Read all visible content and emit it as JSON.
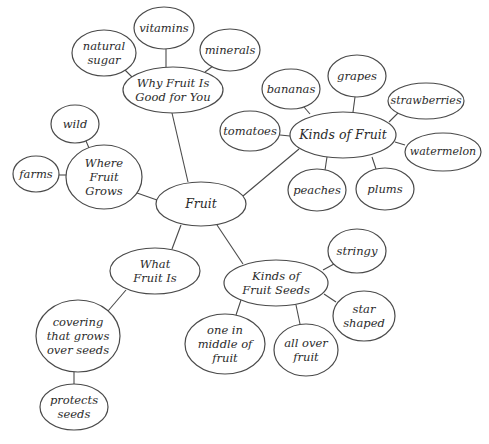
{
  "diagram": {
    "type": "mind-map",
    "line_color": "#4a4a4a",
    "background": "#ffffff",
    "nodes": [
      {
        "id": "fruit",
        "label": "Fruit",
        "cx": 201,
        "cy": 204,
        "rx": 45,
        "ry": 22
      },
      {
        "id": "why",
        "label": "Why Fruit Is\nGood for You",
        "cx": 173,
        "cy": 90,
        "rx": 50,
        "ry": 23
      },
      {
        "id": "vitamins",
        "label": "vitamins",
        "cx": 164,
        "cy": 28,
        "rx": 30,
        "ry": 21
      },
      {
        "id": "natural-sugar",
        "label": "natural\nsugar",
        "cx": 104,
        "cy": 53,
        "rx": 32,
        "ry": 23
      },
      {
        "id": "minerals",
        "label": "minerals",
        "cx": 230,
        "cy": 50,
        "rx": 30,
        "ry": 21
      },
      {
        "id": "kinds-of-fruit",
        "label": "Kinds of Fruit",
        "cx": 343,
        "cy": 135,
        "rx": 53,
        "ry": 23
      },
      {
        "id": "bananas",
        "label": "bananas",
        "cx": 291,
        "cy": 89,
        "rx": 29,
        "ry": 20
      },
      {
        "id": "grapes",
        "label": "grapes",
        "cx": 357,
        "cy": 76,
        "rx": 29,
        "ry": 21
      },
      {
        "id": "strawberries",
        "label": "strawberries",
        "cx": 426,
        "cy": 101,
        "rx": 38,
        "ry": 18
      },
      {
        "id": "tomatoes",
        "label": "tomatoes",
        "cx": 250,
        "cy": 131,
        "rx": 30,
        "ry": 20
      },
      {
        "id": "watermelon",
        "label": "watermelon",
        "cx": 443,
        "cy": 152,
        "rx": 38,
        "ry": 19
      },
      {
        "id": "peaches",
        "label": "peaches",
        "cx": 317,
        "cy": 190,
        "rx": 29,
        "ry": 21
      },
      {
        "id": "plums",
        "label": "plums",
        "cx": 385,
        "cy": 189,
        "rx": 29,
        "ry": 21
      },
      {
        "id": "where",
        "label": "Where\nFruit\nGrows",
        "cx": 104,
        "cy": 177,
        "rx": 38,
        "ry": 32
      },
      {
        "id": "wild",
        "label": "wild",
        "cx": 75,
        "cy": 124,
        "rx": 24,
        "ry": 19
      },
      {
        "id": "farms",
        "label": "farms",
        "cx": 36,
        "cy": 174,
        "rx": 23,
        "ry": 18
      },
      {
        "id": "what",
        "label": "What\nFruit Is",
        "cx": 155,
        "cy": 271,
        "rx": 45,
        "ry": 23
      },
      {
        "id": "covering",
        "label": "covering\nthat grows\nover seeds",
        "cx": 78,
        "cy": 336,
        "rx": 42,
        "ry": 36
      },
      {
        "id": "protects",
        "label": "protects\nseeds",
        "cx": 74,
        "cy": 407,
        "rx": 34,
        "ry": 23
      },
      {
        "id": "kinds-of-seeds",
        "label": "Kinds of\nFruit Seeds",
        "cx": 276,
        "cy": 283,
        "rx": 52,
        "ry": 23
      },
      {
        "id": "stringy",
        "label": "stringy",
        "cx": 357,
        "cy": 251,
        "rx": 29,
        "ry": 22
      },
      {
        "id": "star-shaped",
        "label": "star\nshaped",
        "cx": 364,
        "cy": 316,
        "rx": 31,
        "ry": 25
      },
      {
        "id": "one-in-middle",
        "label": "one in\nmiddle of\nfruit",
        "cx": 225,
        "cy": 344,
        "rx": 40,
        "ry": 30
      },
      {
        "id": "all-over",
        "label": "all over\nfruit",
        "cx": 306,
        "cy": 350,
        "rx": 32,
        "ry": 26
      }
    ],
    "edges": [
      {
        "from": "fruit",
        "to": "why",
        "x1": 188,
        "y1": 182,
        "x2": 172,
        "y2": 113
      },
      {
        "from": "why",
        "to": "vitamins",
        "x1": 166,
        "y1": 67,
        "x2": 166,
        "y2": 49
      },
      {
        "from": "why",
        "to": "natural-sugar",
        "x1": 132,
        "y1": 77,
        "x2": 125,
        "y2": 70
      },
      {
        "from": "why",
        "to": "minerals",
        "x1": 205,
        "y1": 72,
        "x2": 213,
        "y2": 66
      },
      {
        "from": "fruit",
        "to": "kinds-of-fruit",
        "x1": 243,
        "y1": 196,
        "x2": 299,
        "y2": 149
      },
      {
        "from": "kinds-of-fruit",
        "to": "bananas",
        "x1": 310,
        "y1": 114,
        "x2": 304,
        "y2": 107
      },
      {
        "from": "kinds-of-fruit",
        "to": "grapes",
        "x1": 353,
        "y1": 112,
        "x2": 355,
        "y2": 97
      },
      {
        "from": "kinds-of-fruit",
        "to": "strawberries",
        "x1": 389,
        "y1": 122,
        "x2": 398,
        "y2": 113
      },
      {
        "from": "kinds-of-fruit",
        "to": "tomatoes",
        "x1": 290,
        "y1": 136,
        "x2": 280,
        "y2": 135
      },
      {
        "from": "kinds-of-fruit",
        "to": "watermelon",
        "x1": 395,
        "y1": 142,
        "x2": 405,
        "y2": 145
      },
      {
        "from": "kinds-of-fruit",
        "to": "peaches",
        "x1": 327,
        "y1": 157,
        "x2": 325,
        "y2": 170
      },
      {
        "from": "kinds-of-fruit",
        "to": "plums",
        "x1": 372,
        "y1": 157,
        "x2": 376,
        "y2": 169
      },
      {
        "from": "fruit",
        "to": "where",
        "x1": 157,
        "y1": 200,
        "x2": 137,
        "y2": 193
      },
      {
        "from": "where",
        "to": "wild",
        "x1": 89,
        "y1": 148,
        "x2": 86,
        "y2": 141
      },
      {
        "from": "where",
        "to": "farms",
        "x1": 66,
        "y1": 175,
        "x2": 59,
        "y2": 175
      },
      {
        "from": "fruit",
        "to": "what",
        "x1": 181,
        "y1": 225,
        "x2": 172,
        "y2": 249
      },
      {
        "from": "fruit",
        "to": "kinds-of-seeds",
        "x1": 217,
        "y1": 225,
        "x2": 243,
        "y2": 264
      },
      {
        "from": "what",
        "to": "covering",
        "x1": 126,
        "y1": 290,
        "x2": 108,
        "y2": 311
      },
      {
        "from": "covering",
        "to": "protects",
        "x1": 74,
        "y1": 372,
        "x2": 74,
        "y2": 384
      },
      {
        "from": "kinds-of-seeds",
        "to": "stringy",
        "x1": 323,
        "y1": 270,
        "x2": 334,
        "y2": 264
      },
      {
        "from": "kinds-of-seeds",
        "to": "star-shaped",
        "x1": 324,
        "y1": 294,
        "x2": 336,
        "y2": 302
      },
      {
        "from": "kinds-of-seeds",
        "to": "one-in-middle",
        "x1": 241,
        "y1": 300,
        "x2": 236,
        "y2": 315
      },
      {
        "from": "kinds-of-seeds",
        "to": "all-over",
        "x1": 296,
        "y1": 305,
        "x2": 300,
        "y2": 324
      }
    ]
  }
}
